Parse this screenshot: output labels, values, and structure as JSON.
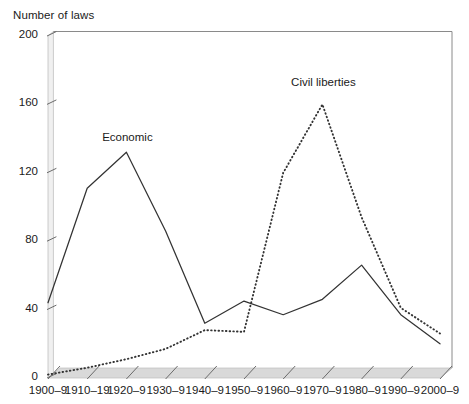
{
  "chart_data": {
    "type": "line",
    "title": "Number of laws",
    "xlabel": "",
    "ylabel": "Number of laws",
    "ylim": [
      0,
      200
    ],
    "yticks": [
      0,
      40,
      80,
      120,
      160,
      200
    ],
    "ytick_labels": [
      "0",
      "40",
      "80",
      "120",
      "160",
      "200"
    ],
    "grid": false,
    "legend_position": "inline-annotations",
    "categories": [
      "1900–9",
      "1910–19",
      "1920–9",
      "1930–9",
      "1940–9",
      "1950–9",
      "1960–9",
      "1970–9",
      "1980–9",
      "1990–9",
      "2000–9"
    ],
    "series": [
      {
        "name": "Economic",
        "style": "solid",
        "color": "#333333",
        "values": [
          44,
          111,
          132,
          86,
          32,
          45,
          37,
          46,
          66,
          37,
          20
        ]
      },
      {
        "name": "Civil liberties",
        "style": "dotted",
        "color": "#333333",
        "values": [
          2,
          6,
          11,
          17,
          28,
          27,
          120,
          160,
          94,
          41,
          26
        ]
      }
    ],
    "annotations": [
      {
        "text": "Economic",
        "x_category": "1920–9",
        "y_value": 140
      },
      {
        "text": "Civil liberties",
        "x_category": "1970–9",
        "y_value": 172
      }
    ]
  },
  "axes": {
    "y_axis_title": "Number of laws",
    "x_axis_title": ""
  }
}
